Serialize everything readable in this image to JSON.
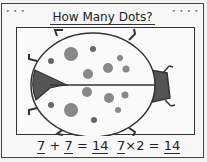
{
  "title": "How Many Dots?",
  "corner_marks": {
    "left": "• • •",
    "right": "• • • •"
  },
  "image": {
    "subject": "ladybug-icon",
    "dots_per_wing": 7,
    "colors": {
      "dot": "#888888",
      "head": "#555555",
      "outline": "#333333"
    }
  },
  "equations": [
    {
      "a": "7",
      "op": "+",
      "b": "7",
      "eq": "=",
      "result": "14"
    },
    {
      "a": "7",
      "op": "×",
      "b": "2",
      "eq": "=",
      "result": "14"
    }
  ]
}
